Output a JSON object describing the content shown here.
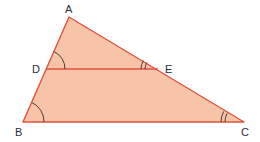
{
  "diagram": {
    "type": "similar-triangles",
    "colors": {
      "fill": "#f7c4a8",
      "stroke": "#e0523f",
      "arc": "#3a2a2a",
      "label": "#2b2b3a"
    },
    "points": {
      "A": {
        "label": "A",
        "x": 69,
        "y": 17
      },
      "B": {
        "label": "B",
        "x": 23,
        "y": 122
      },
      "C": {
        "label": "C",
        "x": 244,
        "y": 122
      },
      "D": {
        "label": "D",
        "x": 46,
        "y": 69
      },
      "E": {
        "label": "E",
        "x": 158,
        "y": 69
      }
    },
    "segments": [
      "AB",
      "AC",
      "BC",
      "DE"
    ],
    "angle_marks": [
      {
        "vertex": "D",
        "arcs": 1
      },
      {
        "vertex": "B",
        "arcs": 1
      },
      {
        "vertex": "E",
        "arcs": 2
      },
      {
        "vertex": "C",
        "arcs": 2
      }
    ]
  }
}
